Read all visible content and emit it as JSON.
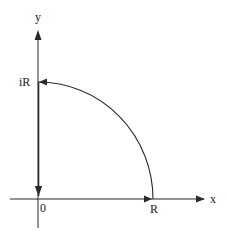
{
  "diagram": {
    "type": "contour-integral-quarter-circle",
    "colors": {
      "stroke": "#2a2a2a",
      "background": "#ffffff"
    },
    "axes": {
      "x_label": "x",
      "y_label": "y"
    },
    "points": {
      "origin": "0",
      "real_end": "R",
      "imag_end": "iR"
    },
    "path": [
      {
        "segment": "line",
        "from": "0",
        "to": "R",
        "direction": "right"
      },
      {
        "segment": "arc",
        "from": "R",
        "to": "iR",
        "direction": "counterclockwise"
      },
      {
        "segment": "line",
        "from": "iR",
        "to": "0",
        "direction": "down"
      }
    ]
  }
}
